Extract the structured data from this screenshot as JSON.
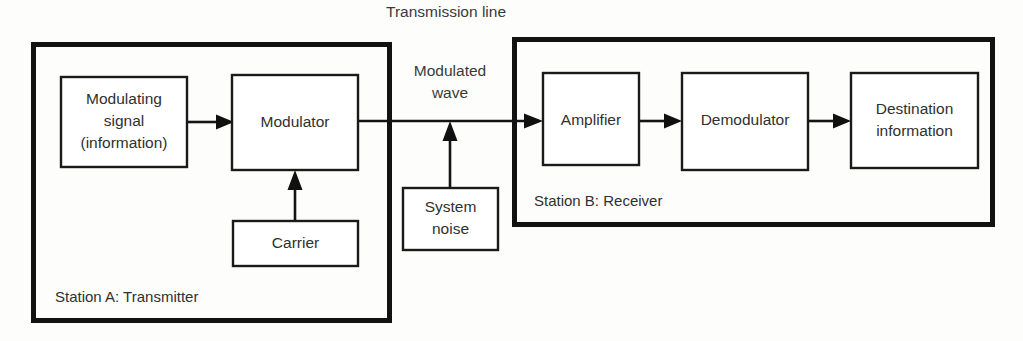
{
  "diagram": {
    "background_color": "#fdfdfc",
    "line_color": "#141414",
    "frame_color": "#121212",
    "box_fill": "#ffffff"
  },
  "labels": {
    "transmission_line": "Transmission line",
    "modulated_wave_line1": "Modulated",
    "modulated_wave_line2": "wave"
  },
  "stations": {
    "transmitter": {
      "caption": "Station A: Transmitter",
      "frame": {
        "x": 31,
        "y": 42,
        "width": 361,
        "height": 281
      }
    },
    "receiver": {
      "caption": "Station B: Receiver",
      "frame": {
        "x": 512,
        "y": 37,
        "width": 483,
        "height": 190
      }
    }
  },
  "blocks": [
    {
      "id": "modulating-signal",
      "lines": [
        "Modulating",
        "signal",
        "(information)"
      ],
      "x": 61,
      "y": 77,
      "width": 126,
      "height": 90
    },
    {
      "id": "modulator",
      "lines": [
        "Modulator"
      ],
      "x": 232,
      "y": 75,
      "width": 126,
      "height": 95
    },
    {
      "id": "carrier",
      "lines": [
        "Carrier"
      ],
      "x": 233,
      "y": 221,
      "width": 125,
      "height": 45
    },
    {
      "id": "system-noise",
      "lines": [
        "System",
        "noise"
      ],
      "x": 403,
      "y": 188,
      "width": 95,
      "height": 62
    },
    {
      "id": "amplifier",
      "lines": [
        "Amplifier"
      ],
      "x": 543,
      "y": 73,
      "width": 96,
      "height": 92
    },
    {
      "id": "demodulator",
      "lines": [
        "Demodulator"
      ],
      "x": 682,
      "y": 73,
      "width": 126,
      "height": 97
    },
    {
      "id": "destination-information",
      "lines": [
        "Destination",
        "information"
      ],
      "x": 851,
      "y": 73,
      "width": 127,
      "height": 95
    }
  ],
  "connections": [
    {
      "id": "modulating-to-modulator",
      "from": "modulating-signal",
      "to": "modulator",
      "direction": "right"
    },
    {
      "id": "modulator-to-transmission-line",
      "from": "modulator",
      "to": "amplifier",
      "direction": "right"
    },
    {
      "id": "carrier-to-modulator",
      "from": "carrier",
      "to": "modulator",
      "direction": "up"
    },
    {
      "id": "noise-to-transmission-line",
      "from": "system-noise",
      "to": "transmission-line",
      "direction": "up"
    },
    {
      "id": "amplifier-to-demodulator",
      "from": "amplifier",
      "to": "demodulator",
      "direction": "right"
    },
    {
      "id": "demodulator-to-destination",
      "from": "demodulator",
      "to": "destination-information",
      "direction": "right"
    }
  ]
}
